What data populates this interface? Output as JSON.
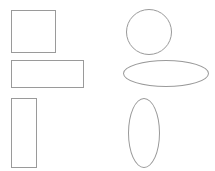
{
  "canvas": {
    "width": 215,
    "height": 171,
    "background_color": "#ffffff",
    "stroke_color": "#9a9a9a",
    "stroke_width": 1,
    "fill": "none",
    "title": "Geometric shapes comparison"
  },
  "columns": [
    {
      "name": "rectangles-column",
      "label": "Rectangles"
    },
    {
      "name": "ellipses-column",
      "label": "Ellipses"
    }
  ],
  "shapes": [
    {
      "id": "square",
      "name": "square-shape",
      "label": "Square",
      "type": "rectangle",
      "column": "rectangles-column",
      "row": 1,
      "x": 11,
      "y": 10,
      "width": 45,
      "height": 43,
      "stroke": "#9a9a9a",
      "fill": "none"
    },
    {
      "id": "wide-rect",
      "name": "wide-rectangle-shape",
      "label": "Wide rectangle",
      "type": "rectangle",
      "column": "rectangles-column",
      "row": 2,
      "x": 11,
      "y": 60,
      "width": 73,
      "height": 28,
      "stroke": "#9a9a9a",
      "fill": "none"
    },
    {
      "id": "tall-rect",
      "name": "tall-rectangle-shape",
      "label": "Tall rectangle",
      "type": "rectangle",
      "column": "rectangles-column",
      "row": 3,
      "x": 11,
      "y": 98,
      "width": 26,
      "height": 70,
      "stroke": "#9a9a9a",
      "fill": "none"
    },
    {
      "id": "circle",
      "name": "circle-shape",
      "label": "Circle",
      "type": "ellipse",
      "column": "ellipses-column",
      "row": 1,
      "x": 126,
      "y": 9,
      "width": 46,
      "height": 46,
      "stroke": "#9a9a9a",
      "fill": "none"
    },
    {
      "id": "wide-ellipse",
      "name": "wide-ellipse-shape",
      "label": "Wide ellipse",
      "type": "ellipse",
      "column": "ellipses-column",
      "row": 2,
      "x": 123,
      "y": 60,
      "width": 86,
      "height": 27,
      "stroke": "#9a9a9a",
      "fill": "none"
    },
    {
      "id": "tall-ellipse",
      "name": "tall-ellipse-shape",
      "label": "Tall ellipse",
      "type": "ellipse",
      "column": "ellipses-column",
      "row": 3,
      "x": 128,
      "y": 98,
      "width": 32,
      "height": 70,
      "stroke": "#9a9a9a",
      "fill": "none"
    }
  ]
}
